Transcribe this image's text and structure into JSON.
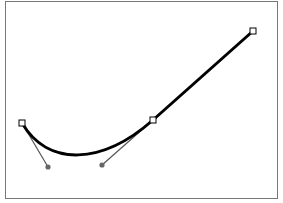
{
  "diagram": {
    "type": "bezier-path",
    "frame": {
      "x": 5,
      "y": 1,
      "width": 272,
      "height": 198,
      "stroke": "#777777"
    },
    "path": {
      "stroke": "#000000",
      "stroke_width": 3,
      "d": "M22,123 C48,167 102,165 153,120 L253,31"
    },
    "anchors": [
      {
        "name": "anchor-start",
        "x": 22,
        "y": 123
      },
      {
        "name": "anchor-middle",
        "x": 153,
        "y": 120
      },
      {
        "name": "anchor-end",
        "x": 253,
        "y": 31
      }
    ],
    "handles": [
      {
        "name": "handle-start",
        "from": [
          22,
          123
        ],
        "to": [
          48,
          167
        ]
      },
      {
        "name": "handle-middle",
        "from": [
          153,
          120
        ],
        "to": [
          102,
          165
        ]
      }
    ],
    "colors": {
      "handle_line": "#555555",
      "handle_dot": "#666666",
      "anchor_fill": "#ffffff",
      "anchor_stroke": "#000000"
    }
  }
}
